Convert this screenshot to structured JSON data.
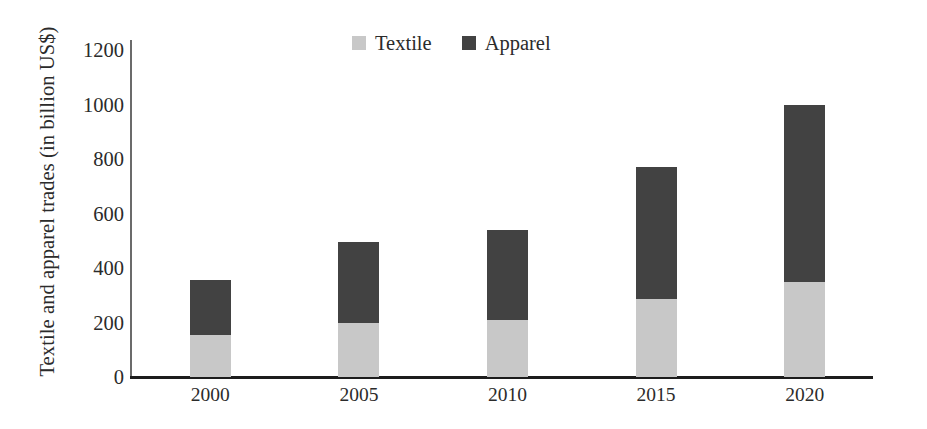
{
  "chart_data": {
    "type": "bar",
    "subtype": "stacked-vertical-bar",
    "title": "",
    "xlabel": "",
    "ylabel": "Textile and apparel trades (in billion US$)",
    "categories": [
      "2000",
      "2005",
      "2010",
      "2015",
      "2020"
    ],
    "series": [
      {
        "name": "Textile",
        "color": "#c8c8c8",
        "values": [
          155,
          200,
          210,
          285,
          350
        ]
      },
      {
        "name": "Apparel",
        "color": "#424242",
        "values": [
          200,
          295,
          330,
          485,
          650
        ]
      }
    ],
    "totals": [
      355,
      495,
      540,
      770,
      1000
    ],
    "ylim": [
      0,
      1200
    ],
    "ytick_values": [
      0,
      200,
      400,
      600,
      800,
      1000,
      1200
    ],
    "ytick_labels": [
      "0",
      "200",
      "400",
      "600",
      "800",
      "1000",
      "1200"
    ],
    "grid": false,
    "legend_position": "top-center",
    "legend_entries": [
      {
        "label": "Textile",
        "swatch_color": "#c8c8c8",
        "icon": "legend-swatch-icon"
      },
      {
        "label": "Apparel",
        "swatch_color": "#424242",
        "icon": "legend-swatch-icon"
      }
    ],
    "axis_color": "#1d1d1d",
    "background_color": "#ffffff",
    "text_color": "#2b2b2b"
  }
}
